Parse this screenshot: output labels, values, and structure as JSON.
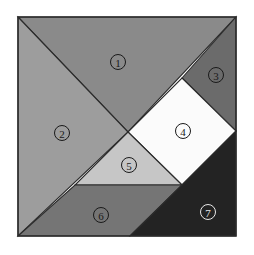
{
  "figure": {
    "background_color": "#ffffff",
    "outline_color": "#2b2b2b",
    "square": {
      "x": 18,
      "y": 17,
      "width": 218,
      "height": 219
    }
  },
  "pieces": [
    {
      "id": "piece-1",
      "label": "①",
      "number": "1",
      "shape": "large-triangle",
      "color": "#8a8a8a",
      "points": "18,17 236,17 128,132",
      "label_x": 118,
      "label_y": 62,
      "label_style": "dark"
    },
    {
      "id": "piece-2",
      "label": "②",
      "number": "2",
      "shape": "large-triangle",
      "color": "#9d9d9d",
      "points": "18,17 128,132 18,236",
      "label_x": 62,
      "label_y": 133,
      "label_style": "dark"
    },
    {
      "id": "piece-3",
      "label": "③",
      "number": "3",
      "shape": "small-triangle",
      "color": "#6b6b6b",
      "points": "182,78 236,17 236,131",
      "label_x": 216,
      "label_y": 75,
      "label_style": "dark"
    },
    {
      "id": "piece-4",
      "label": "④",
      "number": "4",
      "shape": "square",
      "color": "#fbfbfb",
      "points": "182,78 236,131 182,185 128,132",
      "label_x": 183,
      "label_y": 131,
      "label_style": "dark"
    },
    {
      "id": "piece-5",
      "label": "⑤",
      "number": "5",
      "shape": "small-triangle",
      "color": "#c6c6c6",
      "points": "128,132 182,185 75,185",
      "label_x": 129,
      "label_y": 165,
      "label_style": "dark"
    },
    {
      "id": "piece-6",
      "label": "⑥",
      "number": "6",
      "shape": "parallelogram",
      "color": "#757575",
      "points": "75,185 182,185 130,236 18,236",
      "label_x": 101,
      "label_y": 215,
      "label_style": "dark"
    },
    {
      "id": "piece-7",
      "label": "⑦",
      "number": "7",
      "shape": "large-triangle",
      "color": "#232323",
      "points": "182,185 236,131 236,236 130,236",
      "label_x": 208,
      "label_y": 212,
      "label_style": "light"
    }
  ]
}
